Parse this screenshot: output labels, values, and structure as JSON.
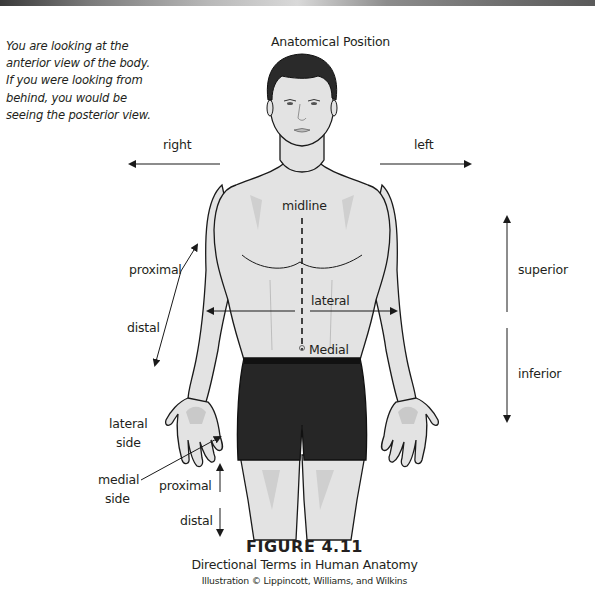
{
  "intro_note": {
    "lines": [
      "You are looking at the",
      "anterior view of the body.",
      "If you were looking from",
      "behind, you would be",
      "seeing the posterior view."
    ]
  },
  "diagram": {
    "title": "Anatomical Position",
    "labels": {
      "right": "right",
      "left": "left",
      "midline": "midline",
      "proximal_arm": "proximal",
      "distal_arm": "distal",
      "lateral": "lateral",
      "medial": "Medial",
      "superior": "superior",
      "inferior": "inferior",
      "lateral_side_1": "lateral",
      "lateral_side_2": "side",
      "medial_side_1": "medial",
      "medial_side_2": "side",
      "proximal_leg": "proximal",
      "distal_leg": "distal"
    },
    "colors": {
      "skin": "#e3e3e3",
      "skin_shadow": "#c9c9c9",
      "outline": "#1a1a1a",
      "hair": "#2a2a2a",
      "shorts": "#262626",
      "text": "#231f20"
    }
  },
  "caption": {
    "figure_number": "FIGURE 4.11",
    "title": "Directional Terms in Human Anatomy",
    "credit": "Illustration © Lippincott, Williams, and Wilkins"
  }
}
